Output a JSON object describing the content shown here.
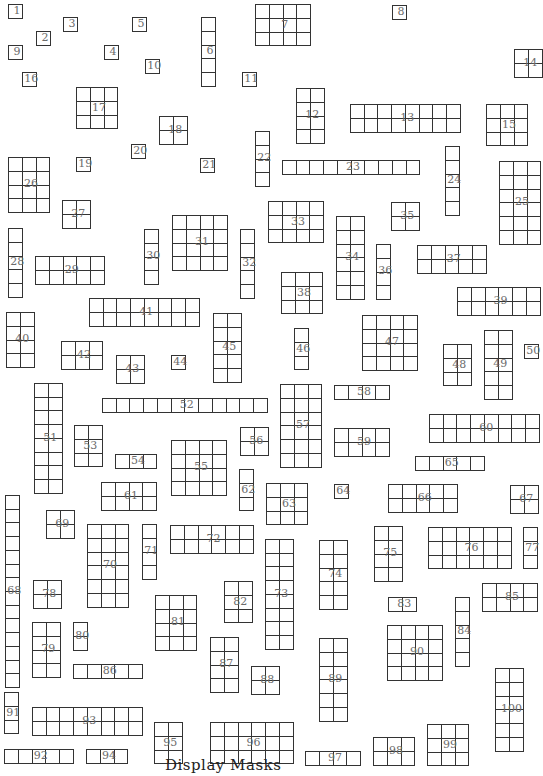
{
  "diagram": {
    "cell_size": 13.7,
    "stroke_color": "#333333",
    "label_color": "#6b6b6b",
    "caption": "Display Masks",
    "blocks": [
      {
        "id": "1",
        "x": 8,
        "y": 4,
        "cols": 1,
        "rows": 1
      },
      {
        "id": "2",
        "x": 36,
        "y": 31,
        "cols": 1,
        "rows": 1
      },
      {
        "id": "3",
        "x": 63,
        "y": 17,
        "cols": 1,
        "rows": 1
      },
      {
        "id": "4",
        "x": 104,
        "y": 45,
        "cols": 1,
        "rows": 1
      },
      {
        "id": "5",
        "x": 132,
        "y": 17,
        "cols": 1,
        "rows": 1
      },
      {
        "id": "6",
        "x": 201,
        "y": 17,
        "cols": 1,
        "rows": 5
      },
      {
        "id": "7",
        "x": 255,
        "y": 4,
        "cols": 4,
        "rows": 3
      },
      {
        "id": "8",
        "x": 392,
        "y": 5,
        "cols": 1,
        "rows": 1
      },
      {
        "id": "9",
        "x": 8,
        "y": 45,
        "cols": 1,
        "rows": 1
      },
      {
        "id": "10",
        "x": 145,
        "y": 59,
        "cols": 1,
        "rows": 1
      },
      {
        "id": "11",
        "x": 242,
        "y": 72,
        "cols": 1,
        "rows": 1
      },
      {
        "id": "12",
        "x": 296,
        "y": 88,
        "cols": 2,
        "rows": 4
      },
      {
        "id": "13",
        "x": 350,
        "y": 104,
        "cols": 8,
        "rows": 2
      },
      {
        "id": "14",
        "x": 514,
        "y": 49,
        "cols": 2,
        "rows": 2
      },
      {
        "id": "15",
        "x": 486,
        "y": 104,
        "cols": 3,
        "rows": 3
      },
      {
        "id": "16",
        "x": 22,
        "y": 72,
        "cols": 1,
        "rows": 1
      },
      {
        "id": "17",
        "x": 76,
        "y": 87,
        "cols": 3,
        "rows": 3
      },
      {
        "id": "18",
        "x": 159,
        "y": 116,
        "cols": 2,
        "rows": 2
      },
      {
        "id": "19",
        "x": 76,
        "y": 157,
        "cols": 1,
        "rows": 1
      },
      {
        "id": "20",
        "x": 131,
        "y": 144,
        "cols": 1,
        "rows": 1
      },
      {
        "id": "21",
        "x": 200,
        "y": 158,
        "cols": 1,
        "rows": 1
      },
      {
        "id": "22",
        "x": 255,
        "y": 131,
        "cols": 1,
        "rows": 4
      },
      {
        "id": "23",
        "x": 282,
        "y": 160,
        "cols": 10,
        "rows": 1
      },
      {
        "id": "24",
        "x": 445,
        "y": 146,
        "cols": 1,
        "rows": 5
      },
      {
        "id": "25",
        "x": 499,
        "y": 161,
        "cols": 3,
        "rows": 6
      },
      {
        "id": "26",
        "x": 8,
        "y": 157,
        "cols": 3,
        "rows": 4
      },
      {
        "id": "27",
        "x": 62,
        "y": 200,
        "cols": 2,
        "rows": 2
      },
      {
        "id": "28",
        "x": 8,
        "y": 228,
        "cols": 1,
        "rows": 5
      },
      {
        "id": "29",
        "x": 35,
        "y": 256,
        "cols": 5,
        "rows": 2
      },
      {
        "id": "30",
        "x": 144,
        "y": 229,
        "cols": 1,
        "rows": 4
      },
      {
        "id": "31",
        "x": 172,
        "y": 215,
        "cols": 4,
        "rows": 4
      },
      {
        "id": "32",
        "x": 240,
        "y": 229,
        "cols": 1,
        "rows": 5
      },
      {
        "id": "33",
        "x": 268,
        "y": 201,
        "cols": 4,
        "rows": 3
      },
      {
        "id": "34",
        "x": 336,
        "y": 216,
        "cols": 2,
        "rows": 6
      },
      {
        "id": "35",
        "x": 391,
        "y": 202,
        "cols": 2,
        "rows": 2
      },
      {
        "id": "36",
        "x": 376,
        "y": 244,
        "cols": 1,
        "rows": 4
      },
      {
        "id": "37",
        "x": 417,
        "y": 245,
        "cols": 5,
        "rows": 2
      },
      {
        "id": "38",
        "x": 281,
        "y": 272,
        "cols": 3,
        "rows": 3
      },
      {
        "id": "39",
        "x": 457,
        "y": 287,
        "cols": 6,
        "rows": 2
      },
      {
        "id": "40",
        "x": 6,
        "y": 312,
        "cols": 2,
        "rows": 4
      },
      {
        "id": "41",
        "x": 89,
        "y": 298,
        "cols": 8,
        "rows": 2
      },
      {
        "id": "42",
        "x": 61,
        "y": 341,
        "cols": 3,
        "rows": 2
      },
      {
        "id": "43",
        "x": 116,
        "y": 355,
        "cols": 2,
        "rows": 2
      },
      {
        "id": "44",
        "x": 171,
        "y": 355,
        "cols": 1,
        "rows": 1
      },
      {
        "id": "45",
        "x": 213,
        "y": 313,
        "cols": 2,
        "rows": 5
      },
      {
        "id": "46",
        "x": 294,
        "y": 328,
        "cols": 1,
        "rows": 3
      },
      {
        "id": "47",
        "x": 362,
        "y": 315,
        "cols": 4,
        "rows": 4
      },
      {
        "id": "48",
        "x": 443,
        "y": 344,
        "cols": 2,
        "rows": 3
      },
      {
        "id": "49",
        "x": 484,
        "y": 330,
        "cols": 2,
        "rows": 5
      },
      {
        "id": "50",
        "x": 524,
        "y": 344,
        "cols": 1,
        "rows": 1
      },
      {
        "id": "51",
        "x": 34,
        "y": 383,
        "cols": 2,
        "rows": 8
      },
      {
        "id": "52",
        "x": 102,
        "y": 398,
        "cols": 12,
        "rows": 1
      },
      {
        "id": "53",
        "x": 74,
        "y": 425,
        "cols": 2,
        "rows": 3
      },
      {
        "id": "54",
        "x": 115,
        "y": 454,
        "cols": 3,
        "rows": 1
      },
      {
        "id": "55",
        "x": 171,
        "y": 440,
        "cols": 4,
        "rows": 4
      },
      {
        "id": "56",
        "x": 240,
        "y": 427,
        "cols": 2,
        "rows": 2
      },
      {
        "id": "57",
        "x": 280,
        "y": 384,
        "cols": 3,
        "rows": 6
      },
      {
        "id": "58",
        "x": 334,
        "y": 385,
        "cols": 4,
        "rows": 1
      },
      {
        "id": "59",
        "x": 334,
        "y": 428,
        "cols": 4,
        "rows": 2
      },
      {
        "id": "60",
        "x": 429,
        "y": 414,
        "cols": 8,
        "rows": 2
      },
      {
        "id": "61",
        "x": 101,
        "y": 482,
        "cols": 4,
        "rows": 2
      },
      {
        "id": "62",
        "x": 239,
        "y": 469,
        "cols": 1,
        "rows": 3
      },
      {
        "id": "63",
        "x": 266,
        "y": 483,
        "cols": 3,
        "rows": 3
      },
      {
        "id": "64",
        "x": 334,
        "y": 484,
        "cols": 1,
        "rows": 1
      },
      {
        "id": "65",
        "x": 415,
        "y": 456,
        "cols": 5,
        "rows": 1
      },
      {
        "id": "66",
        "x": 388,
        "y": 484,
        "cols": 5,
        "rows": 2
      },
      {
        "id": "67",
        "x": 510,
        "y": 485,
        "cols": 2,
        "rows": 2
      },
      {
        "id": "68",
        "x": 5,
        "y": 495,
        "cols": 1,
        "rows": 14
      },
      {
        "id": "69",
        "x": 46,
        "y": 510,
        "cols": 2,
        "rows": 2
      },
      {
        "id": "70",
        "x": 87,
        "y": 524,
        "cols": 3,
        "rows": 6
      },
      {
        "id": "71",
        "x": 142,
        "y": 524,
        "cols": 1,
        "rows": 4
      },
      {
        "id": "72",
        "x": 170,
        "y": 525,
        "cols": 6,
        "rows": 2
      },
      {
        "id": "73",
        "x": 265,
        "y": 539,
        "cols": 2,
        "rows": 8
      },
      {
        "id": "74",
        "x": 319,
        "y": 540,
        "cols": 2,
        "rows": 5
      },
      {
        "id": "75",
        "x": 374,
        "y": 526,
        "cols": 2,
        "rows": 4
      },
      {
        "id": "76",
        "x": 428,
        "y": 527,
        "cols": 6,
        "rows": 3
      },
      {
        "id": "77",
        "x": 523,
        "y": 527,
        "cols": 1,
        "rows": 3
      },
      {
        "id": "78",
        "x": 33,
        "y": 580,
        "cols": 2,
        "rows": 2
      },
      {
        "id": "79",
        "x": 32,
        "y": 622,
        "cols": 2,
        "rows": 4
      },
      {
        "id": "80",
        "x": 73,
        "y": 622,
        "cols": 1,
        "rows": 2
      },
      {
        "id": "81",
        "x": 155,
        "y": 595,
        "cols": 3,
        "rows": 4
      },
      {
        "id": "82",
        "x": 224,
        "y": 581,
        "cols": 2,
        "rows": 3
      },
      {
        "id": "83",
        "x": 388,
        "y": 597,
        "cols": 2,
        "rows": 1
      },
      {
        "id": "84",
        "x": 455,
        "y": 597,
        "cols": 1,
        "rows": 5
      },
      {
        "id": "85",
        "x": 482,
        "y": 583,
        "cols": 4,
        "rows": 2
      },
      {
        "id": "86",
        "x": 73,
        "y": 664,
        "cols": 5,
        "rows": 1
      },
      {
        "id": "87",
        "x": 210,
        "y": 637,
        "cols": 2,
        "rows": 4
      },
      {
        "id": "88",
        "x": 251,
        "y": 666,
        "cols": 2,
        "rows": 2
      },
      {
        "id": "89",
        "x": 319,
        "y": 638,
        "cols": 2,
        "rows": 6
      },
      {
        "id": "90",
        "x": 387,
        "y": 625,
        "cols": 4,
        "rows": 4
      },
      {
        "id": "91",
        "x": 4,
        "y": 692,
        "cols": 1,
        "rows": 3
      },
      {
        "id": "92",
        "x": 4,
        "y": 749,
        "cols": 5,
        "rows": 1
      },
      {
        "id": "93",
        "x": 32,
        "y": 707,
        "cols": 8,
        "rows": 2
      },
      {
        "id": "94",
        "x": 86,
        "y": 749,
        "cols": 3,
        "rows": 1
      },
      {
        "id": "95",
        "x": 154,
        "y": 722,
        "cols": 2,
        "rows": 3
      },
      {
        "id": "96",
        "x": 210,
        "y": 722,
        "cols": 6,
        "rows": 3
      },
      {
        "id": "97",
        "x": 305,
        "y": 751,
        "cols": 4,
        "rows": 1
      },
      {
        "id": "98",
        "x": 373,
        "y": 737,
        "cols": 3,
        "rows": 2
      },
      {
        "id": "99",
        "x": 427,
        "y": 724,
        "cols": 3,
        "rows": 3
      },
      {
        "id": "100",
        "x": 495,
        "y": 668,
        "cols": 2,
        "rows": 6
      }
    ]
  }
}
